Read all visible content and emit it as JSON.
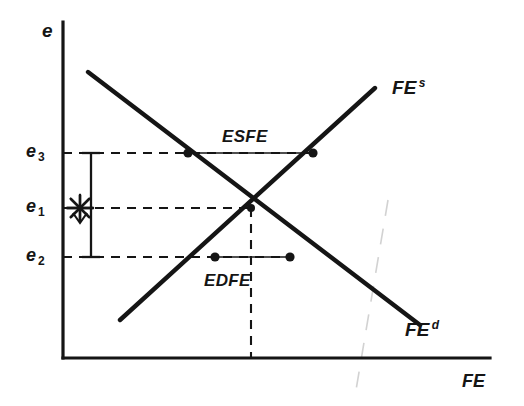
{
  "figure": {
    "type": "economics-supply-demand-diagram",
    "background_color": "#ffffff",
    "ink_color": "#151515",
    "width": 524,
    "height": 406
  },
  "axes": {
    "y_axis_label": "e",
    "x_axis_label": "FE",
    "origin": {
      "x": 63,
      "y": 358
    },
    "y_top": 22,
    "x_right": 490
  },
  "ticks": {
    "e3": {
      "label": "e",
      "sub": "3",
      "y": 153
    },
    "e1": {
      "label": "e",
      "sub": "1",
      "y": 208
    },
    "e2": {
      "label": "e",
      "sub": "2",
      "y": 257
    }
  },
  "curves": {
    "supply": {
      "label": "FE",
      "superscript": "s",
      "x1": 120,
      "y1": 320,
      "x2": 375,
      "y2": 88,
      "label_x": 392,
      "label_y": 78
    },
    "demand": {
      "label": "FE",
      "superscript": "d",
      "x1": 88,
      "y1": 72,
      "x2": 420,
      "y2": 325,
      "label_x": 405,
      "label_y": 320
    }
  },
  "equilibrium": {
    "x": 251,
    "y": 208
  },
  "regions": [
    {
      "name": "excess-supply",
      "label": "ESFE",
      "level_y": 153,
      "left_x": 188,
      "right_x": 313,
      "label_x": 222,
      "label_y": 128
    },
    {
      "name": "excess-demand",
      "label": "EDFE",
      "level_y": 257,
      "left_x": 215,
      "right_x": 290,
      "label_x": 204,
      "label_y": 272
    }
  ],
  "markers": {
    "asterisk": {
      "name": "star-marker",
      "x": 80,
      "y": 208
    },
    "dots": [
      {
        "name": "excess-supply-demand-point",
        "x": 188,
        "y": 153
      },
      {
        "name": "excess-supply-supply-point",
        "x": 313,
        "y": 153
      },
      {
        "name": "excess-demand-supply-point",
        "x": 215,
        "y": 257
      },
      {
        "name": "excess-demand-demand-point",
        "x": 290,
        "y": 257
      },
      {
        "name": "equilibrium-point",
        "x": 251,
        "y": 208
      }
    ],
    "range_arrow": {
      "name": "vertical-range-arrow",
      "x": 91,
      "y_top": 153,
      "y_bottom": 257
    }
  },
  "guides": {
    "horizontal_dashed": [
      {
        "name": "e3-guide",
        "y": 153,
        "x1": 63,
        "x2": 313
      },
      {
        "name": "e1-guide",
        "y": 208,
        "x1": 63,
        "x2": 251
      },
      {
        "name": "e2-guide",
        "y": 257,
        "x1": 63,
        "x2": 290
      }
    ],
    "vertical_dashed": [
      {
        "name": "equilibrium-guide",
        "x": 251,
        "y1": 208,
        "y2": 358
      }
    ]
  },
  "artifact": {
    "name": "scan-fold-line",
    "x1": 388,
    "y1": 200,
    "x2": 355,
    "y2": 396
  }
}
